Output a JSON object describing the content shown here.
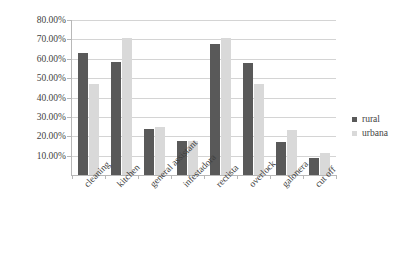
{
  "chart_data": {
    "type": "bar",
    "title": "",
    "subtitle": "",
    "xlabel": "",
    "ylabel": "",
    "categories": [
      "cleaning",
      "kitchen",
      "general assistant",
      "infestadora",
      "rectista",
      "overlock",
      "galonera",
      "cut off"
    ],
    "series": [
      {
        "name": "rural",
        "color": "#595959",
        "values": [
          63.0,
          58.5,
          24.0,
          17.5,
          67.5,
          58.0,
          17.0,
          9.0
        ]
      },
      {
        "name": "urbana",
        "color": "#d9d9d9",
        "values": [
          47.0,
          70.5,
          25.0,
          17.5,
          70.5,
          47.0,
          23.0,
          11.5
        ]
      }
    ],
    "ylim": [
      0,
      80
    ],
    "ytick_values": [
      10,
      20,
      30,
      40,
      50,
      60,
      70,
      80
    ],
    "ytick_labels": [
      "10.00%",
      "20.00%",
      "30.00%",
      "40.00%",
      "50.00%",
      "60.00%",
      "70.00%",
      "80.00%"
    ],
    "grid": true,
    "grid_axis": "y",
    "legend_position": "right",
    "value_suffix": "%"
  },
  "legend": {
    "entries": [
      {
        "label": "rural",
        "color": "#595959"
      },
      {
        "label": "urbana",
        "color": "#d9d9d9"
      }
    ]
  },
  "colors": {
    "rural": "#595959",
    "urbana": "#d9d9d9",
    "gridline": "#d4d4d4",
    "axis": "#b8b8b8",
    "text": "#3f3f3f",
    "background": "#ffffff"
  }
}
